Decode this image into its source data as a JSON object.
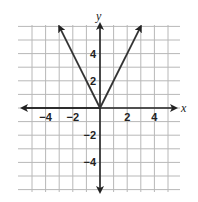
{
  "chart_data": {
    "type": "line",
    "title": "",
    "function": "y = 2|x|",
    "xlabel": "x",
    "ylabel": "y",
    "xlim": [
      -5.5,
      5.5
    ],
    "ylim": [
      -6,
      6
    ],
    "grid": true,
    "x_ticks": [
      -4,
      -2,
      2,
      4
    ],
    "y_ticks": [
      4,
      2,
      -2,
      -4
    ],
    "x_tick_labels": [
      "−4",
      "−2",
      "2",
      "4"
    ],
    "y_tick_labels": [
      "4",
      "2",
      "−2",
      "−4"
    ],
    "series": [
      {
        "name": "y = 2|x|",
        "x": [
          -3,
          0,
          3
        ],
        "y": [
          6,
          0,
          6
        ],
        "arrows": "both-ends"
      }
    ],
    "vertex": [
      0,
      0
    ]
  },
  "labels": {
    "x_axis": "x",
    "y_axis": "y"
  }
}
